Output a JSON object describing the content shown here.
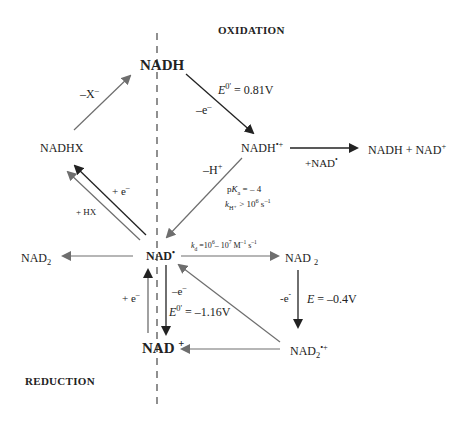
{
  "sections": {
    "oxidation": "OXIDATION",
    "reduction": "REDUCTION"
  },
  "species": {
    "nadh": "NADH",
    "nadhx": "NADHX",
    "nadh_radical_cation": {
      "base": "NADH",
      "sup": "•+"
    },
    "products_right": {
      "text": "NADH + NAD",
      "sup": "+"
    },
    "nad_radical": {
      "base": "NAD",
      "sup": "•"
    },
    "nad2_left": {
      "base": "NAD",
      "sub": "2"
    },
    "nad2_right": {
      "base": "NAD",
      "sub": "2"
    },
    "nad2_radical_cation": {
      "base": "NAD",
      "sub": "2",
      "sup": "•+"
    },
    "nad_plus": {
      "base": "NAD",
      "sup": "+"
    }
  },
  "annotations": {
    "minus_x": {
      "text": "–X",
      "sup": "–"
    },
    "e_ox_nadh": {
      "e": "E",
      "sup": "0'",
      "rest": " = 0.81V"
    },
    "minus_e_top": {
      "text": "–e",
      "sup": "–"
    },
    "plus_nad_radical": {
      "text": "+NAD",
      "sup": "•"
    },
    "minus_h": {
      "text": "–H",
      "sup": "+"
    },
    "pka": {
      "p": "p",
      "k": "K",
      "sub": "a",
      "rest": " = – 4"
    },
    "kh": {
      "k": "k",
      "sub": "H⁺",
      "rest": " > 10",
      "sup": "6",
      "unit": " s",
      "unit_sup": "–1"
    },
    "plus_e_upper": {
      "text": "+ e",
      "sup": "–"
    },
    "plus_hx": "+ HX",
    "kd": {
      "k": "k",
      "sub": "d",
      "rest": " =10",
      "sup1": "6",
      "mid": "– 10",
      "sup2": "7",
      "unit": " M",
      "u1": "–1",
      "s": " s",
      "u2": "–1"
    },
    "plus_e_lower": {
      "text": "+ e",
      "sup": "–"
    },
    "minus_e_lower": {
      "text": "–e",
      "sup": "–"
    },
    "e_red_nad": {
      "e": "E",
      "sup": "0'",
      "rest": " = –1.16V"
    },
    "minus_e_nad2": {
      "text": "-e",
      "sup": "-"
    },
    "e_nad2": {
      "e": "E",
      "rest": " = –0.4V"
    }
  },
  "colors": {
    "arrow_dark": "#222222",
    "arrow_gray": "#6e6e6e",
    "divider": "#555555"
  }
}
